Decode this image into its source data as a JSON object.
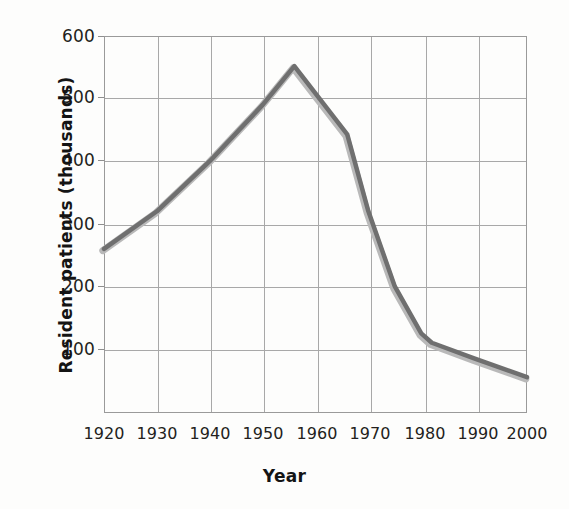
{
  "figure": {
    "background": "#fdfdfc",
    "axis_color": "#9a9a9a",
    "grid_color": "#a8a8a8",
    "text_color": "#231f20"
  },
  "chart_data": {
    "type": "line",
    "title": "",
    "xlabel": "Year",
    "ylabel": "Resident patients (thousands)",
    "xlim": [
      1920,
      2000
    ],
    "ylim": [
      0,
      600
    ],
    "xticks": [
      1920,
      1930,
      1940,
      1950,
      1960,
      1970,
      1980,
      1990,
      2000
    ],
    "xtick_labels": [
      "1920",
      "1930",
      "1940",
      "1950",
      "1960",
      "1970",
      "1980",
      "1990",
      "2000"
    ],
    "yticks": [
      100,
      200,
      300,
      400,
      500,
      600
    ],
    "ytick_labels": [
      "100",
      "200",
      "300",
      "400",
      "500",
      "600"
    ],
    "grid": true,
    "legend": "none",
    "series": [
      {
        "name": "Resident patients",
        "color": "#6f6f6f",
        "shadow_color": "#b9b9b9",
        "line_width": 5,
        "x": [
          1920,
          1930,
          1940,
          1950,
          1956,
          1966,
          1970,
          1975,
          1980,
          1982,
          1990,
          2000
        ],
        "y": [
          260,
          320,
          400,
          490,
          552,
          443,
          320,
          200,
          125,
          110,
          85,
          55
        ]
      }
    ]
  }
}
